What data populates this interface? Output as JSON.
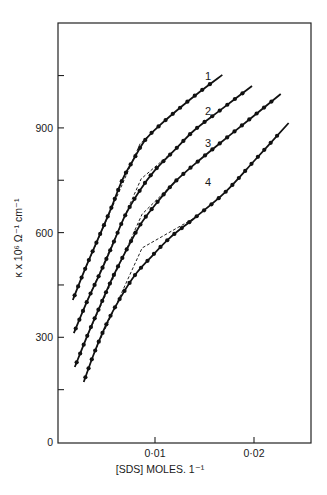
{
  "chart_data": {
    "type": "line",
    "title": "",
    "xlabel": "[SDS] MOLES. 1⁻¹",
    "ylabel": "κ x 10⁶ Ω⁻¹ cm⁻¹",
    "xlim": [
      0,
      0.0256
    ],
    "ylim": [
      0,
      1200
    ],
    "x_ticks": [
      {
        "value": 0.01,
        "label": "0·01"
      },
      {
        "value": 0.02,
        "label": "0·02"
      }
    ],
    "y_ticks": [
      {
        "value": 0,
        "label": "0"
      },
      {
        "value": 300,
        "label": "300"
      },
      {
        "value": 600,
        "label": "600"
      },
      {
        "value": 900,
        "label": "900"
      }
    ],
    "y_minor_ticks": [
      150,
      450,
      750,
      1050
    ],
    "grid": false,
    "legend": "none (curves labelled 1–4 inline)",
    "series": [
      {
        "name": "1",
        "x": [
          0.0017,
          0.0029,
          0.0042,
          0.0055,
          0.0067,
          0.0078,
          0.009,
          0.0105,
          0.0125,
          0.0145,
          0.0168
        ],
        "y": [
          407,
          493,
          579,
          665,
          751,
          808,
          865,
          908,
          957,
          1003,
          1052
        ],
        "break_point": {
          "x": 0.0085,
          "y": 855
        }
      },
      {
        "name": "2",
        "x": [
          0.0018,
          0.0032,
          0.0045,
          0.0057,
          0.007,
          0.0085,
          0.01,
          0.012,
          0.014,
          0.0166,
          0.0198
        ],
        "y": [
          312,
          407,
          487,
          564,
          650,
          722,
          779,
          837,
          894,
          951,
          1020
        ],
        "break_point": {
          "x": 0.0086,
          "y": 754
        }
      },
      {
        "name": "3",
        "x": [
          0.0019,
          0.0032,
          0.0045,
          0.0057,
          0.007,
          0.0085,
          0.01,
          0.012,
          0.0145,
          0.0176,
          0.0227
        ],
        "y": [
          215,
          307,
          393,
          470,
          544,
          622,
          679,
          745,
          808,
          880,
          997
        ],
        "break_point": {
          "x": 0.0087,
          "y": 653
        }
      },
      {
        "name": "4",
        "x": [
          0.0028,
          0.0039,
          0.0052,
          0.0065,
          0.008,
          0.0095,
          0.0115,
          0.014,
          0.0171,
          0.0201,
          0.0235
        ],
        "y": [
          172,
          258,
          344,
          413,
          479,
          527,
          585,
          642,
          716,
          808,
          914
        ],
        "break_point": {
          "x": 0.0087,
          "y": 556
        }
      }
    ]
  },
  "layout": {
    "plot": {
      "left": 58,
      "top": 23,
      "right": 311,
      "bottom": 443
    },
    "x_px_per_unit": 9900,
    "x_origin_px": 56,
    "y_px_per_unit": 0.349,
    "y_origin_px": 442
  },
  "labels": {
    "y_title": "κ x 10⁶ Ω⁻¹ cm⁻¹",
    "x_title": "[SDS] MOLES. 1⁻¹",
    "curve_1": "1",
    "curve_2": "2",
    "curve_3": "3",
    "curve_4": "4"
  }
}
